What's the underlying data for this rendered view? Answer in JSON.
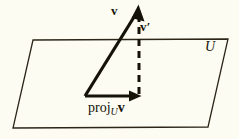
{
  "figure": {
    "background_color": "#fdfcf3",
    "ink_color": "#151208",
    "labels": {
      "vector_v": "v",
      "vector_v_prime_base": "v",
      "vector_v_prime_mark": "′",
      "subspace_U": "U",
      "projection_proj": "proj",
      "projection_subscript": "U",
      "projection_vector": "v"
    },
    "geometry": {
      "plane": {
        "name": "subspace-plane",
        "points": "33,40 228,39 208,127 13,128",
        "stroke": "#2b2618",
        "stroke_width": 1.3,
        "fill": "#fdfcf3"
      },
      "vector_v": {
        "name": "vector-v",
        "origin": [
          85,
          96
        ],
        "tip": [
          138,
          6
        ],
        "stroke_width": 3.2
      },
      "vector_v_prime": {
        "name": "vector-v-prime-dashed",
        "from": [
          139,
          14
        ],
        "to": [
          139,
          96
        ],
        "stroke_width": 3.0,
        "dash": "7,5"
      },
      "projection_arrow": {
        "name": "projection-arrow",
        "origin": [
          85,
          96
        ],
        "tip": [
          141,
          96
        ],
        "stroke_width": 3.2
      }
    }
  }
}
